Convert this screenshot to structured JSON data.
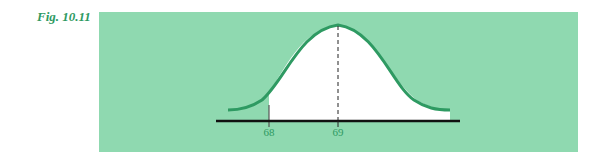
{
  "figure": {
    "label": "Fig. 10.11",
    "colors": {
      "panel": "#8fd9b0",
      "curve": "#2e9a62",
      "shaded_region": "#ffffff",
      "axis": "#111111",
      "label": "#2e9a62"
    },
    "axis": {
      "ticks": [
        {
          "value": "68"
        },
        {
          "value": "69"
        }
      ]
    }
  }
}
